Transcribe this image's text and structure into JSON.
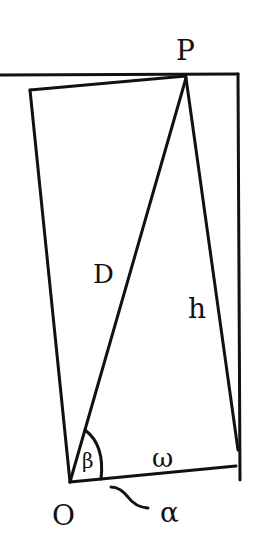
{
  "diagram": {
    "style": "hand-drawn geometry sketch",
    "ink_color": "#111111",
    "background": "#ffffff",
    "points": {
      "P": {
        "label": "P"
      },
      "O": {
        "label": "O"
      }
    },
    "labels": {
      "P": "P",
      "O": "O",
      "D": "D",
      "h": "h",
      "w": "ω",
      "beta": "β",
      "alpha": "α",
      "tilde": "~"
    },
    "segments": [
      {
        "name": "horizontal-top-line",
        "description": "horizontal line through P"
      },
      {
        "name": "right-vertical",
        "description": "vertical line from top line downward"
      },
      {
        "name": "tilted-rect-top",
        "description": "top edge of tilted rectangle to P"
      },
      {
        "name": "tilted-rect-left",
        "description": "left edge of tilted rectangle to O"
      },
      {
        "name": "diagonal-D",
        "description": "diagonal O to P labelled D"
      },
      {
        "name": "side-h",
        "description": "side from P down to right corner labelled h"
      },
      {
        "name": "base-w",
        "description": "base from O to right corner labelled w"
      }
    ]
  }
}
